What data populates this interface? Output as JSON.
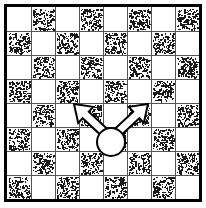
{
  "figure": {
    "name": "checkerboard-diagonal-move-diagram",
    "background_color": "#ffffff",
    "ink_color": "#000000"
  },
  "board": {
    "rows": 8,
    "columns": 8,
    "origin_x": 7,
    "origin_y": 7,
    "cell_size": 24,
    "border_width": 3,
    "border_color": "#000000",
    "grid_line_width": 1,
    "grid_line_color": "#555555",
    "light_square_color": "#ffffff",
    "dark_square_fill": "stipple-texture",
    "dark_square_stipple_color": "#1a1a1a",
    "dark_square_stipple_density": 150,
    "top_left_square": "light",
    "square_pattern": [
      [
        "light",
        "dark",
        "light",
        "dark",
        "light",
        "dark",
        "light",
        "dark"
      ],
      [
        "dark",
        "light",
        "dark",
        "light",
        "dark",
        "light",
        "dark",
        "light"
      ],
      [
        "light",
        "dark",
        "light",
        "dark",
        "light",
        "dark",
        "light",
        "dark"
      ],
      [
        "dark",
        "light",
        "dark",
        "light",
        "dark",
        "light",
        "dark",
        "light"
      ],
      [
        "light",
        "dark",
        "light",
        "dark",
        "light",
        "dark",
        "light",
        "dark"
      ],
      [
        "dark",
        "light",
        "dark",
        "light",
        "dark",
        "light",
        "dark",
        "light"
      ],
      [
        "light",
        "dark",
        "light",
        "dark",
        "light",
        "dark",
        "light",
        "dark"
      ],
      [
        "dark",
        "light",
        "dark",
        "light",
        "dark",
        "light",
        "dark",
        "light"
      ]
    ]
  },
  "piece": {
    "shape": "circle",
    "label": "game-piece",
    "center_x": 111,
    "center_y": 142,
    "radius": 14,
    "fill": "#ffffff",
    "stroke": "#000000",
    "stroke_width": 2,
    "board_row": 5,
    "board_column": 4
  },
  "arrows": [
    {
      "name": "arrow-up-left",
      "direction": "up-left",
      "from_x": 104,
      "from_y": 132,
      "to_x": 74,
      "to_y": 104,
      "target_row": 4,
      "target_column": 3,
      "fill": "#ffffff",
      "stroke": "#000000",
      "stroke_width": 2,
      "shaft_width": 9,
      "head_width": 22,
      "head_length": 16
    },
    {
      "name": "arrow-up-right",
      "direction": "up-right",
      "from_x": 118,
      "from_y": 132,
      "to_x": 148,
      "to_y": 104,
      "target_row": 4,
      "target_column": 5,
      "fill": "#ffffff",
      "stroke": "#000000",
      "stroke_width": 2,
      "shaft_width": 9,
      "head_width": 22,
      "head_length": 16
    }
  ]
}
